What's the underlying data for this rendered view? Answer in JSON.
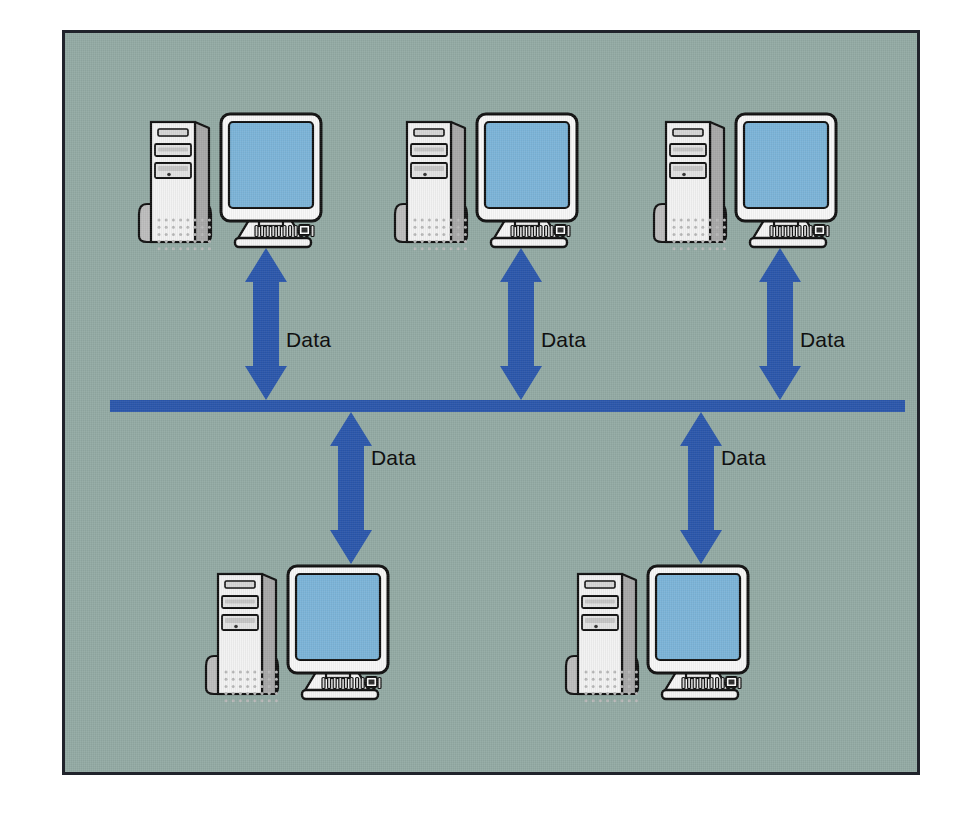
{
  "diagram": {
    "type": "network-topology",
    "background_color": "#93aaa4",
    "frame_border_color": "#20232b",
    "page_background": "#ffffff",
    "bus": {
      "name": "network-bus-line",
      "color": "#2b57ab",
      "x": 110,
      "y": 400,
      "width": 795,
      "height": 12
    },
    "arrow_color": "#2b57ab",
    "monitor_screen_color": "#7cb4d8",
    "tower_body_color": "#f2f2f2",
    "tower_side_color": "#a8a8a8",
    "outline_color": "#111111",
    "nodes": [
      {
        "id": "top-1",
        "label": "Workstation",
        "row": "top",
        "x": 133,
        "y": 108
      },
      {
        "id": "top-2",
        "label": "Workstation",
        "row": "top",
        "x": 389,
        "y": 108
      },
      {
        "id": "top-3",
        "label": "Workstation",
        "row": "top",
        "x": 648,
        "y": 108
      },
      {
        "id": "bottom-1",
        "label": "Workstation",
        "row": "bottom",
        "x": 200,
        "y": 560
      },
      {
        "id": "bottom-2",
        "label": "Workstation",
        "row": "bottom",
        "x": 560,
        "y": 560
      }
    ],
    "connections": [
      {
        "id": "conn-top-1",
        "label": "Data",
        "node": "top-1",
        "arrow_x": 243,
        "arrow_y": 248,
        "arrow_height": 152,
        "label_x": 286,
        "label_y": 328
      },
      {
        "id": "conn-top-2",
        "label": "Data",
        "node": "top-2",
        "arrow_x": 498,
        "arrow_y": 248,
        "arrow_height": 152,
        "label_x": 541,
        "label_y": 328
      },
      {
        "id": "conn-top-3",
        "label": "Data",
        "node": "top-3",
        "arrow_x": 757,
        "arrow_y": 248,
        "arrow_height": 152,
        "label_x": 800,
        "label_y": 328
      },
      {
        "id": "conn-bottom-1",
        "label": "Data",
        "node": "bottom-1",
        "arrow_x": 328,
        "arrow_y": 412,
        "arrow_height": 152,
        "label_x": 371,
        "label_y": 446
      },
      {
        "id": "conn-bottom-2",
        "label": "Data",
        "node": "bottom-2",
        "arrow_x": 678,
        "arrow_y": 412,
        "arrow_height": 152,
        "label_x": 721,
        "label_y": 446
      }
    ]
  }
}
